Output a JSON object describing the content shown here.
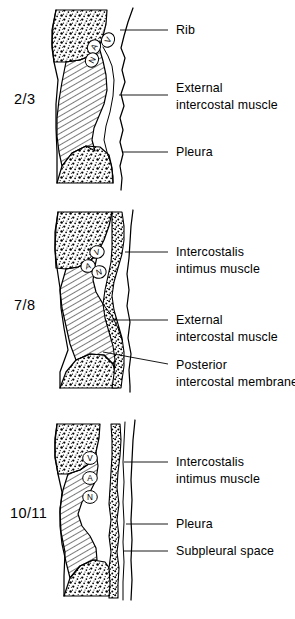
{
  "figure": {
    "background_color": "#ffffff",
    "ink_color": "#000000"
  },
  "panels": [
    {
      "id": "panel-2-3",
      "level_label": "2/3",
      "vessels": [
        {
          "code": "V",
          "meaning": "vein"
        },
        {
          "code": "A",
          "meaning": "artery"
        },
        {
          "code": "N",
          "meaning": "nerve"
        }
      ],
      "labels": [
        {
          "id": "label-rib",
          "lines": [
            "Rib"
          ]
        },
        {
          "id": "label-external-intercostal-muscle",
          "lines": [
            "External",
            "intercostal muscle"
          ]
        },
        {
          "id": "label-pleura",
          "lines": [
            "Pleura"
          ]
        }
      ]
    },
    {
      "id": "panel-7-8",
      "level_label": "7/8",
      "vessels": [
        {
          "code": "V",
          "meaning": "vein"
        },
        {
          "code": "A",
          "meaning": "artery"
        },
        {
          "code": "N",
          "meaning": "nerve"
        }
      ],
      "labels": [
        {
          "id": "label-intercostalis-intimus-muscle",
          "lines": [
            "Intercostalis",
            "intimus muscle"
          ]
        },
        {
          "id": "label-external-intercostal-muscle",
          "lines": [
            "External",
            "intercostal  muscle"
          ]
        },
        {
          "id": "label-posterior-intercostal-membrane",
          "lines": [
            "Posterior",
            "intercostal  membrane"
          ]
        }
      ]
    },
    {
      "id": "panel-10-11",
      "level_label": "10/11",
      "vessels": [
        {
          "code": "V",
          "meaning": "vein"
        },
        {
          "code": "A",
          "meaning": "artery"
        },
        {
          "code": "N",
          "meaning": "nerve"
        }
      ],
      "labels": [
        {
          "id": "label-intercostalis-intimus-muscle",
          "lines": [
            "Intercostalis",
            "intimus muscle"
          ]
        },
        {
          "id": "label-pleura",
          "lines": [
            "Pleura"
          ]
        },
        {
          "id": "label-subpleural-space",
          "lines": [
            "Subpleural  space"
          ]
        }
      ]
    }
  ]
}
